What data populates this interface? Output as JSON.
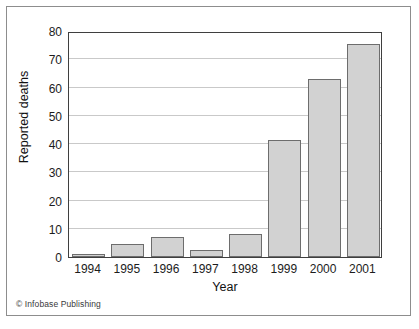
{
  "figure": {
    "credit": "© Infobase Publishing"
  },
  "chart_data": {
    "type": "bar",
    "title": "",
    "subtitle": "",
    "xlabel": "Year",
    "ylabel": "Reported deaths",
    "categories": [
      "1994",
      "1995",
      "1996",
      "1997",
      "1998",
      "1999",
      "2000",
      "2001"
    ],
    "values": [
      1,
      4.7,
      7,
      2.5,
      8.3,
      41.5,
      63,
      75.3
    ],
    "series": [
      {
        "name": "Reported deaths",
        "values": [
          1,
          4.7,
          7,
          2.5,
          8.3,
          41.5,
          63,
          75.3
        ]
      }
    ],
    "ylim": [
      0,
      80
    ],
    "yticks": [
      0,
      10,
      20,
      30,
      40,
      50,
      60,
      70,
      80
    ],
    "ytick_labels": [
      "0",
      "10",
      "20",
      "30",
      "40",
      "50",
      "60",
      "70",
      "80"
    ],
    "grid": true,
    "grid_axis": "y",
    "legend": false,
    "legend_position": "none",
    "bar_fill_color": "#d2d2d2",
    "bar_edge_color": "#6d6d6d",
    "gridline_color": "#c9c9c9",
    "axis_color": "#3f3f3f",
    "annotations": []
  }
}
